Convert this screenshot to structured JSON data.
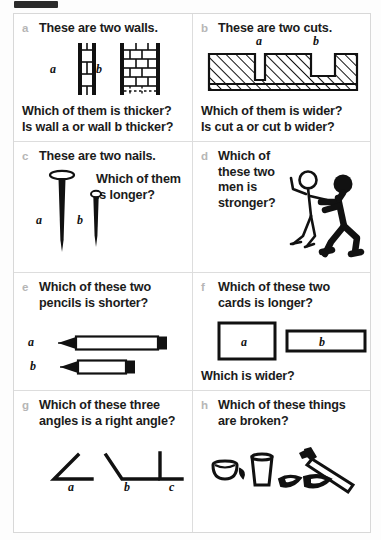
{
  "page": {
    "marker_color": "#2b2b2b",
    "border_color": "#d8d8d8",
    "letter_color": "#b6b6b6",
    "text_color": "#1b1b1b"
  },
  "panels": [
    {
      "letter": "a",
      "prompt": "These are two walls.",
      "footer": "Which of them is thicker?\nIs wall a or wall b thicker?",
      "figure": "two-walls",
      "labels": [
        "a",
        "b"
      ]
    },
    {
      "letter": "b",
      "prompt": "These are two cuts.",
      "footer": "Which of them is wider?\nIs cut a or cut b wider?",
      "figure": "two-cuts",
      "labels": [
        "a",
        "b"
      ]
    },
    {
      "letter": "c",
      "prompt": "These are two nails.",
      "side": "Which of them\nis longer?",
      "figure": "two-nails",
      "labels": [
        "a",
        "b"
      ]
    },
    {
      "letter": "d",
      "prompt": "Which of\nthese two\nmen is\nstronger?",
      "figure": "two-men",
      "labels": []
    },
    {
      "letter": "e",
      "prompt": "Which of these two\npencils is shorter?",
      "figure": "two-pencils",
      "labels": [
        "a",
        "b"
      ]
    },
    {
      "letter": "f",
      "prompt": "Which of these two\ncards is longer?",
      "footer": "Which is wider?",
      "figure": "two-cards",
      "labels": [
        "a",
        "b"
      ]
    },
    {
      "letter": "g",
      "prompt": "Which of these three\nangles is a right angle?",
      "figure": "three-angles",
      "labels": [
        "a",
        "b",
        "c"
      ]
    },
    {
      "letter": "h",
      "prompt": "Which of these things\nare broken?",
      "figure": "broken-things",
      "labels": []
    }
  ]
}
